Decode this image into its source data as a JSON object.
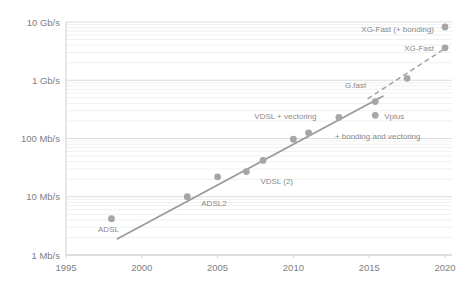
{
  "chart_data": {
    "type": "scatter",
    "title": "",
    "subtitle": "",
    "xlabel": "",
    "ylabel": "",
    "xlim": [
      1995,
      2020
    ],
    "ylim_mbps": [
      1,
      10000
    ],
    "yscale": "log",
    "xscale": "linear",
    "grid": true,
    "grid_minor": true,
    "legend": "none",
    "x_ticks": [
      "1995",
      "2000",
      "2005",
      "2010",
      "2015",
      "2020"
    ],
    "x_tick_values": [
      1995,
      2000,
      2005,
      2010,
      2015,
      2020
    ],
    "y_ticks": [
      "1 Mb/s",
      "10 Mb/s",
      "100 Mb/s",
      "1 Gb/s",
      "10 Gb/s"
    ],
    "y_tick_values_mbps": [
      1,
      10,
      100,
      1000,
      10000
    ],
    "point_color": "#a6a6a6",
    "line_color": "#9a9a9a",
    "dashed_line_color": "#a6a6a6",
    "points": [
      {
        "label": "ADSL",
        "x": 1998.0,
        "y_mbps": 4.2,
        "label_dx": -3,
        "label_dy": 13,
        "label_anchor": "middle"
      },
      {
        "label": "ADSL2",
        "x": 2003.0,
        "y_mbps": 10.0,
        "label_dx": 14,
        "label_dy": 9,
        "label_anchor": "start"
      },
      {
        "label": "",
        "x": 2005.0,
        "y_mbps": 22.0,
        "label_dx": 0,
        "label_dy": 0,
        "label_anchor": "start"
      },
      {
        "label": "VDSL (2)",
        "x": 2006.9,
        "y_mbps": 27.0,
        "label_dx": 14,
        "label_dy": 12,
        "label_anchor": "start"
      },
      {
        "label": "",
        "x": 2008.0,
        "y_mbps": 42.0,
        "label_dx": 0,
        "label_dy": 0,
        "label_anchor": "start"
      },
      {
        "label": "VDSL + vectoring",
        "x": 2010.0,
        "y_mbps": 97.0,
        "label_dx": -8,
        "label_dy": -20,
        "label_anchor": "middle"
      },
      {
        "label": "",
        "x": 2011.0,
        "y_mbps": 125.0,
        "label_dx": 0,
        "label_dy": 0,
        "label_anchor": "start"
      },
      {
        "label": "+ bonding  and vectoring",
        "x": 2013.0,
        "y_mbps": 230.0,
        "label_dx": -4,
        "label_dy": 22,
        "label_anchor": "start"
      },
      {
        "label": "G.fast",
        "x": 2015.4,
        "y_mbps": 430.0,
        "label_dx": -9,
        "label_dy": -14,
        "label_anchor": "end"
      },
      {
        "label": "Vplus",
        "x": 2015.4,
        "y_mbps": 250.0,
        "label_dx": 9,
        "label_dy": 4,
        "label_anchor": "start"
      },
      {
        "label": "",
        "x": 2017.5,
        "y_mbps": 1080.0,
        "label_dx": 0,
        "label_dy": 0,
        "label_anchor": "start"
      },
      {
        "label": "XG-Fast",
        "x": 2020.0,
        "y_mbps": 3600.0,
        "label_dx": -11,
        "label_dy": 3,
        "label_anchor": "end"
      },
      {
        "label": "XG-Fast (+ bonding)",
        "x": 2020.0,
        "y_mbps": 8200.0,
        "label_dx": -11,
        "label_dy": 5,
        "label_anchor": "end"
      }
    ],
    "trend_line": {
      "style": "solid",
      "x_start": 1998.4,
      "y_start_mbps": 1.9,
      "x_end": 2015.9,
      "y_end_mbps": 530.0
    },
    "trend_line_dashed": {
      "style": "dashed",
      "x_start": 2014.9,
      "y_start_mbps": 480.0,
      "x_end": 2020.2,
      "y_end_mbps": 3800.0
    },
    "annotations": [
      {
        "name": "cutoff-header-text",
        "text": ""
      }
    ]
  }
}
